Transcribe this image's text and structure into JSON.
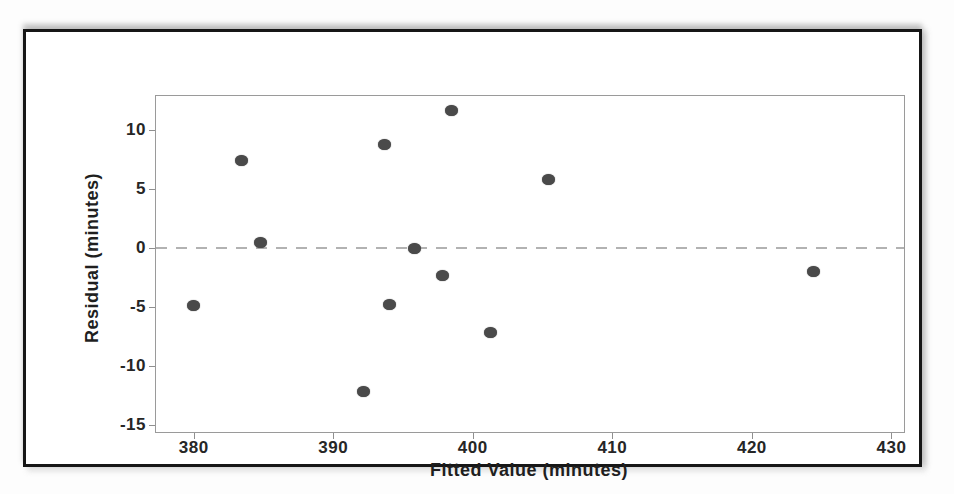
{
  "figure": {
    "frame_color": "#161616",
    "background": "#ffffff"
  },
  "chart_data": {
    "type": "scatter",
    "title": "",
    "xlabel": "Fitted Value (minutes)",
    "ylabel": "Residual (minutes)",
    "xlim": [
      377.3,
      430.9
    ],
    "ylim": [
      -15.6,
      12.9
    ],
    "x_ticks": [
      380,
      390,
      400,
      410,
      420,
      430
    ],
    "y_ticks": [
      10,
      5,
      0,
      -5,
      -10,
      -15
    ],
    "grid": false,
    "legend": "none",
    "point_color": "#4a4a4a",
    "reference_line": {
      "y": 0,
      "style": "dashed",
      "color": "#b2b2b2"
    },
    "points": [
      {
        "x": 380.0,
        "y": -4.9
      },
      {
        "x": 383.4,
        "y": 7.4
      },
      {
        "x": 384.8,
        "y": 0.5
      },
      {
        "x": 392.2,
        "y": -12.2
      },
      {
        "x": 393.7,
        "y": 8.8
      },
      {
        "x": 394.0,
        "y": -4.8
      },
      {
        "x": 395.8,
        "y": 0.0
      },
      {
        "x": 397.8,
        "y": -2.3
      },
      {
        "x": 398.5,
        "y": 11.7
      },
      {
        "x": 401.3,
        "y": -7.2
      },
      {
        "x": 405.4,
        "y": 5.8
      },
      {
        "x": 424.4,
        "y": -2.0
      }
    ]
  }
}
